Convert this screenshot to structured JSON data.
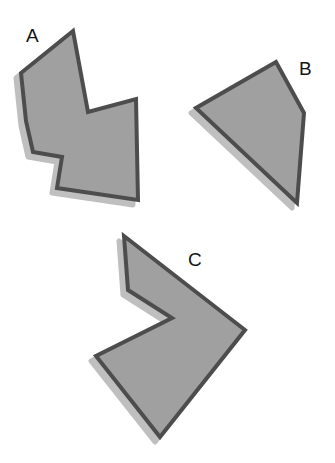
{
  "figure": {
    "background_color": "#ffffff",
    "canvas": {
      "width": 335,
      "height": 463
    },
    "style": {
      "fill_color": "#a0a0a0",
      "stroke_color": "#4d4d4d",
      "stroke_width": 4,
      "shadow_color": "#bfbfbf",
      "shadow_offset_x": -5,
      "shadow_offset_y": 5,
      "label_color": "#141414",
      "label_font_size": 19
    },
    "shapes": [
      {
        "id": "shape-a",
        "label": "A",
        "label_position": {
          "x": 26,
          "y": 26
        },
        "vertex_count": 8,
        "concave": true,
        "points": "73,31 21,73 26,121 33,152 62,157 57,188 138,200 136,99 88,112",
        "vertices": [
          {
            "x": 73,
            "y": 31
          },
          {
            "x": 21,
            "y": 73
          },
          {
            "x": 26,
            "y": 121
          },
          {
            "x": 33,
            "y": 152
          },
          {
            "x": 62,
            "y": 157
          },
          {
            "x": 57,
            "y": 188
          },
          {
            "x": 138,
            "y": 200
          },
          {
            "x": 136,
            "y": 99
          },
          {
            "x": 88,
            "y": 112
          }
        ]
      },
      {
        "id": "shape-b",
        "label": "B",
        "label_position": {
          "x": 299,
          "y": 59
        },
        "vertex_count": 4,
        "concave": false,
        "points": "276,62 196,108 297,203 304,113",
        "vertices": [
          {
            "x": 276,
            "y": 62
          },
          {
            "x": 196,
            "y": 108
          },
          {
            "x": 297,
            "y": 203
          },
          {
            "x": 304,
            "y": 113
          }
        ]
      },
      {
        "id": "shape-c",
        "label": "C",
        "label_position": {
          "x": 188,
          "y": 250
        },
        "vertex_count": 6,
        "concave": true,
        "points": "124,236 128,290 172,318 96,356 160,437 245,330",
        "vertices": [
          {
            "x": 124,
            "y": 236
          },
          {
            "x": 128,
            "y": 290
          },
          {
            "x": 172,
            "y": 318
          },
          {
            "x": 96,
            "y": 356
          },
          {
            "x": 160,
            "y": 437
          },
          {
            "x": 245,
            "y": 330
          }
        ]
      }
    ]
  }
}
